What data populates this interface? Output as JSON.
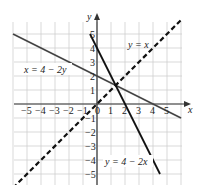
{
  "chart_data": {
    "type": "line",
    "title": "",
    "xlabel": "x",
    "ylabel": "y",
    "xlim": [
      -6,
      6
    ],
    "ylim": [
      -6,
      6
    ],
    "grid": true,
    "x_ticks": [
      "-5",
      "-4",
      "-3",
      "-2",
      "-1",
      "0",
      "1",
      "2",
      "3",
      "4",
      "5"
    ],
    "y_ticks": [
      "-5",
      "-4",
      "-3",
      "-2",
      "-1",
      "1",
      "2",
      "3",
      "4",
      "5"
    ],
    "series": [
      {
        "name": "x = 4 - 2y",
        "style": "solid",
        "points": [
          [
            -6,
            5
          ],
          [
            6,
            -1
          ]
        ]
      },
      {
        "name": "y = 4 - 2x",
        "style": "solid",
        "points": [
          [
            -0.5,
            5
          ],
          [
            4.5,
            -5
          ]
        ]
      },
      {
        "name": "y = x",
        "style": "dashed",
        "points": [
          [
            -6,
            -6
          ],
          [
            6,
            6
          ]
        ]
      }
    ],
    "annotations": [
      "x = 4 - 2y",
      "y = x",
      "y = 4 - 2x"
    ]
  },
  "labels": {
    "x_axis": "x",
    "y_axis": "y",
    "line1": "x = 4 − 2y",
    "line2": "y = x",
    "line3": "y = 4 − 2x",
    "origin": "0"
  }
}
